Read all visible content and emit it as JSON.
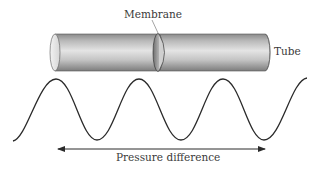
{
  "diagram": {
    "labels": {
      "membrane": "Membrane",
      "tube": "Tube",
      "pressure_difference": "Pressure difference"
    },
    "elements": {
      "tube": {
        "shape": "cylinder",
        "orientation": "horizontal",
        "x_start": 50,
        "x_end": 270,
        "y_top": 34,
        "y_bottom": 71
      },
      "membrane": {
        "shape": "thin-disk",
        "x": 160
      },
      "wave": {
        "shape": "sine",
        "peaks_x": [
          56,
          139,
          223
        ],
        "troughs_x": [
          97,
          181,
          264
        ],
        "peak_y": 79,
        "trough_y": 140
      },
      "arrow": {
        "type": "double-headed",
        "x_start": 57,
        "x_end": 266,
        "y": 149
      }
    },
    "colors": {
      "tube_light": "#e6e6e6",
      "tube_dark": "#7a7a7a",
      "line": "#2a2a2a",
      "text": "#3a3a3a"
    }
  }
}
